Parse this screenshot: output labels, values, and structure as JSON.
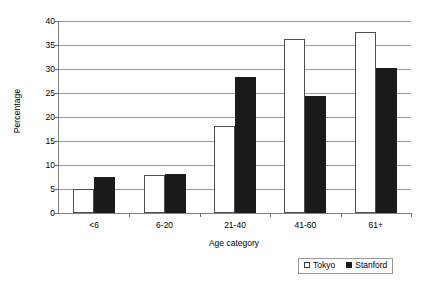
{
  "chart_data": {
    "type": "bar",
    "title": "",
    "subtitle": "",
    "xlabel": "Age category",
    "ylabel": "Percentage",
    "categories": [
      "<6",
      "6-20",
      "21-40",
      "41-60",
      "61+"
    ],
    "series": [
      {
        "name": "Tokyo",
        "color": "#ffffff",
        "values": [
          5.0,
          8.0,
          18.2,
          36.2,
          37.8
        ]
      },
      {
        "name": "Stanford",
        "color": "#1a1a1a",
        "values": [
          7.6,
          8.2,
          28.4,
          24.3,
          30.2
        ]
      }
    ],
    "ylim": [
      0,
      40
    ],
    "yticks": [
      0,
      5,
      10,
      15,
      20,
      25,
      30,
      35,
      40
    ],
    "ytick_labels": [
      "0",
      "5",
      "10",
      "15",
      "20",
      "25",
      "30",
      "35",
      "40"
    ],
    "grid": true,
    "grid_axis": "y",
    "legend_position": "bottom-right",
    "legend_entries": [
      "Tokyo",
      "Stanford"
    ],
    "annotations": []
  },
  "legend": {
    "tokyo_label": "Tokyo",
    "stanford_label": "Stanford"
  }
}
